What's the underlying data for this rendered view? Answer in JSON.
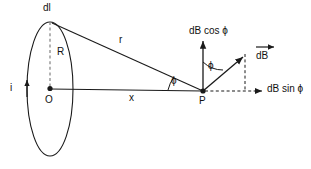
{
  "diagram": {
    "type": "physics-vector-diagram",
    "stroke_color": "#1a1a1a",
    "background_color": "#ffffff",
    "labels": {
      "dl": "dl",
      "R": "R",
      "O": "O",
      "i": "i",
      "r": "r",
      "x": "x",
      "P": "P",
      "phi_axis": "ϕ",
      "phi_vertical": "ϕ",
      "dB_cos_phi": "dB cos ϕ",
      "dB_sin_phi": "dB sin ϕ",
      "dB_vector": "dB"
    },
    "elements": {
      "loop": "current-loop-ellipse",
      "axis": "horizontal-axis-O-to-P",
      "r_line": "radius-vector-dl-to-P",
      "R_dashed": "loop-radius-dashed",
      "dB_arrow": "dB-vector-arrow",
      "dB_cos_arrow": "dB-cos-component-arrow",
      "dB_sin_arrow": "dB-sin-component-arrow",
      "current_arrow": "current-direction-arrow"
    }
  }
}
